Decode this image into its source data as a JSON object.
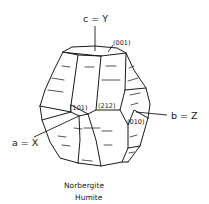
{
  "diagram": {
    "type": "crystal-habit-drawing",
    "axes": {
      "c": {
        "label": "c = Y",
        "direction": "vertical-up"
      },
      "b": {
        "label": "b = Z",
        "direction": "right"
      },
      "a": {
        "label": "a = X",
        "direction": "front-left"
      }
    },
    "faces": [
      {
        "miller": "(001)",
        "position": "top"
      },
      {
        "miller": "(101)",
        "position": "front-center-left"
      },
      {
        "miller": "(212)",
        "position": "front-center"
      },
      {
        "miller": "(010)",
        "position": "right"
      }
    ],
    "caption": {
      "line1": "Norbergite",
      "line2": "Humite"
    },
    "colors": {
      "line": "#1a1a1a",
      "background": "#ffffff"
    }
  }
}
